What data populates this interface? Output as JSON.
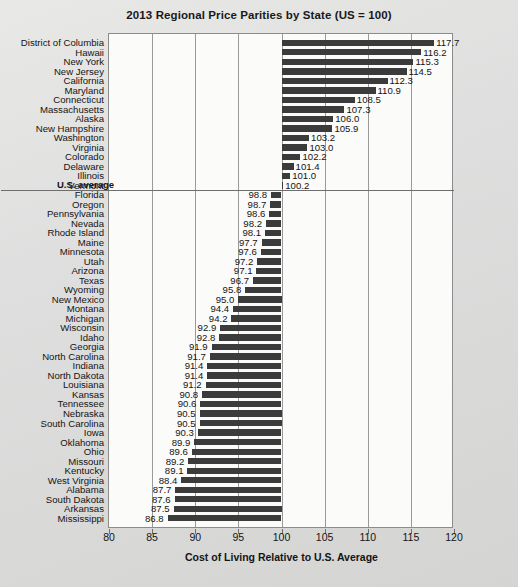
{
  "chart_data": {
    "type": "bar",
    "orientation": "horizontal",
    "title": "2013 Regional Price Parities by State (US = 100)",
    "xlabel": "Cost of Living Relative to U.S. Average",
    "ylabel": "",
    "xlim": [
      80,
      120
    ],
    "xticks": [
      80,
      85,
      90,
      95,
      100,
      105,
      110,
      115,
      120
    ],
    "grid": "vertical",
    "legend": "none",
    "bar_color": "#3b3b3b",
    "plot_background": "#fbfbfa",
    "annotations": [
      {
        "text": "U.S. average",
        "value": 100,
        "after_category": "Vermont"
      }
    ],
    "categories": [
      "District of Columbia",
      "Hawaii",
      "New York",
      "New Jersey",
      "California",
      "Maryland",
      "Connecticut",
      "Massachusetts",
      "Alaska",
      "New Hampshire",
      "Washington",
      "Virginia",
      "Colorado",
      "Delaware",
      "Illinois",
      "Vermont",
      "Florida",
      "Oregon",
      "Pennsylvania",
      "Nevada",
      "Rhode Island",
      "Maine",
      "Minnesota",
      "Utah",
      "Arizona",
      "Texas",
      "Wyoming",
      "New Mexico",
      "Montana",
      "Michigan",
      "Wisconsin",
      "Idaho",
      "Georgia",
      "North Carolina",
      "Indiana",
      "North Dakota",
      "Louisiana",
      "Kansas",
      "Tennessee",
      "Nebraska",
      "South Carolina",
      "Iowa",
      "Oklahoma",
      "Ohio",
      "Missouri",
      "Kentucky",
      "West Virginia",
      "Alabama",
      "South Dakota",
      "Arkansas",
      "Mississippi"
    ],
    "values": [
      117.7,
      116.2,
      115.3,
      114.5,
      112.3,
      110.9,
      108.5,
      107.3,
      106.0,
      105.9,
      103.2,
      103.0,
      102.2,
      101.4,
      101.0,
      100.2,
      98.8,
      98.7,
      98.6,
      98.2,
      98.1,
      97.7,
      97.6,
      97.2,
      97.1,
      96.7,
      95.8,
      95.0,
      94.4,
      94.2,
      92.9,
      92.8,
      91.9,
      91.7,
      91.4,
      91.4,
      91.2,
      90.8,
      90.6,
      90.5,
      90.5,
      90.3,
      89.9,
      89.6,
      89.2,
      89.1,
      88.4,
      87.7,
      87.6,
      87.5,
      86.8
    ],
    "value_labels": [
      "117.7",
      "116.2",
      "115.3",
      "114.5",
      "112.3",
      "110.9",
      "108.5",
      "107.3",
      "106.0",
      "105.9",
      "103.2",
      "103.0",
      "102.2",
      "101.4",
      "101.0",
      "100.2",
      "98.8",
      "98.7",
      "98.6",
      "98.2",
      "98.1",
      "97.7",
      "97.6",
      "97.2",
      "97.1",
      "96.7",
      "95.8",
      "95.0",
      "94.4",
      "94.2",
      "92.9",
      "92.8",
      "91.9",
      "91.7",
      "91.4",
      "91.4",
      "91.2",
      "90.8",
      "90.6",
      "90.5",
      "90.5",
      "90.3",
      "89.9",
      "89.6",
      "89.2",
      "89.1",
      "88.4",
      "87.7",
      "87.6",
      "87.5",
      "86.8"
    ]
  }
}
